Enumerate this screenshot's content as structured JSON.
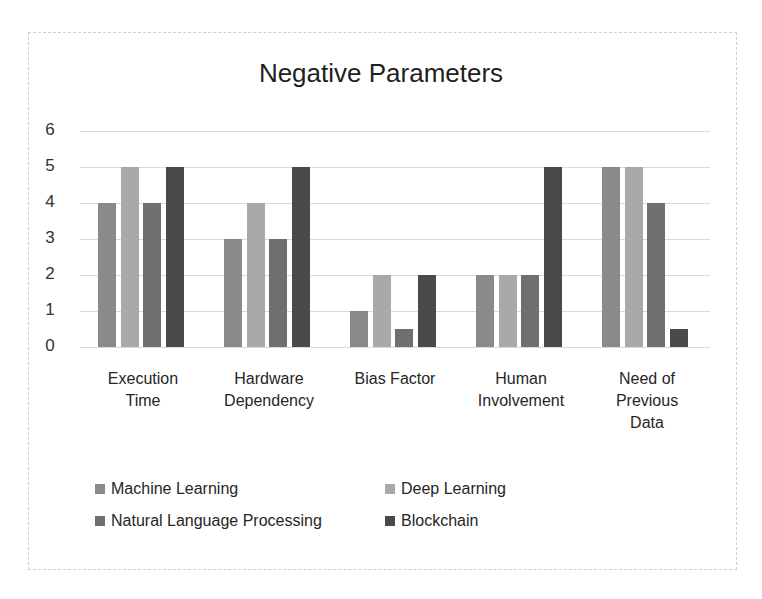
{
  "chart_data": {
    "type": "bar",
    "title": "Negative Parameters",
    "xlabel": "",
    "ylabel": "",
    "ylim": [
      0,
      6
    ],
    "yticks": [
      0,
      1,
      2,
      3,
      4,
      5,
      6
    ],
    "grid": true,
    "legend_position": "bottom",
    "categories": [
      "Execution Time",
      "Hardware Dependency",
      "Bias Factor",
      "Human Involvement",
      "Need of Previous Data"
    ],
    "category_labels": [
      "Execution\nTime",
      "Hardware\nDependency",
      "Bias Factor",
      "Human\nInvolvement",
      "Need of\nPrevious\nData"
    ],
    "series": [
      {
        "name": "Machine Learning",
        "color": "#8a8a8a",
        "values": [
          4,
          3,
          1,
          2,
          5
        ]
      },
      {
        "name": "Deep Learning",
        "color": "#a9a9a9",
        "values": [
          5,
          4,
          2,
          2,
          5
        ]
      },
      {
        "name": "Natural Language Processing",
        "color": "#6f6f6f",
        "values": [
          4,
          3,
          0.5,
          2,
          4
        ]
      },
      {
        "name": "Blockchain",
        "color": "#4a4a4a",
        "values": [
          5,
          5,
          2,
          5,
          0.5
        ]
      }
    ]
  }
}
